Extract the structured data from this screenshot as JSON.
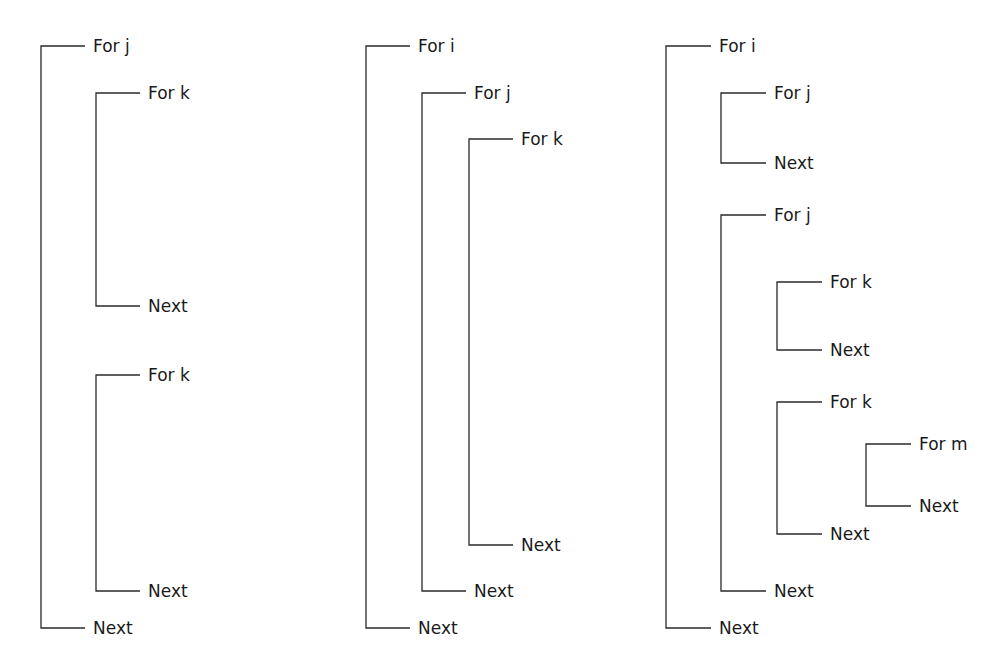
{
  "colors": {
    "line": "#2a2a2a",
    "text": "#1a1a1a",
    "background": "#ffffff"
  },
  "diagrams": [
    {
      "name": "diagram-1",
      "brackets": [
        {
          "x": 41,
          "top": 46,
          "bottom": 628,
          "arm": 44,
          "open_label": "For j",
          "close_label": "Next"
        },
        {
          "x": 96,
          "top": 93,
          "bottom": 306,
          "arm": 44,
          "open_label": "For k",
          "close_label": "Next"
        },
        {
          "x": 96,
          "top": 375,
          "bottom": 591,
          "arm": 44,
          "open_label": "For k",
          "close_label": "Next"
        }
      ]
    },
    {
      "name": "diagram-2",
      "brackets": [
        {
          "x": 366,
          "top": 46,
          "bottom": 628,
          "arm": 44,
          "open_label": "For i",
          "close_label": "Next"
        },
        {
          "x": 422,
          "top": 93,
          "bottom": 591,
          "arm": 44,
          "open_label": "For j",
          "close_label": "Next"
        },
        {
          "x": 469,
          "top": 139,
          "bottom": 545,
          "arm": 44,
          "open_label": "For k",
          "close_label": "Next"
        }
      ]
    },
    {
      "name": "diagram-3",
      "brackets": [
        {
          "x": 666,
          "top": 46,
          "bottom": 628,
          "arm": 45,
          "open_label": "For i",
          "close_label": "Next"
        },
        {
          "x": 721,
          "top": 93,
          "bottom": 163,
          "arm": 45,
          "open_label": "For j",
          "close_label": "Next"
        },
        {
          "x": 721,
          "top": 215,
          "bottom": 591,
          "arm": 45,
          "open_label": "For j",
          "close_label": "Next"
        },
        {
          "x": 777,
          "top": 282,
          "bottom": 350,
          "arm": 45,
          "open_label": "For k",
          "close_label": "Next"
        },
        {
          "x": 777,
          "top": 402,
          "bottom": 534,
          "arm": 45,
          "open_label": "For k",
          "close_label": "Next"
        },
        {
          "x": 866,
          "top": 444,
          "bottom": 506,
          "arm": 45,
          "open_label": "For m",
          "close_label": "Next"
        }
      ]
    }
  ]
}
